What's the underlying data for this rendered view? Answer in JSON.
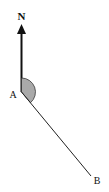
{
  "diagram": {
    "type": "bearing",
    "north_label": "N",
    "point_a_label": "A",
    "point_b_label": "B",
    "colors": {
      "line": "#222222",
      "sector_fill": "#a9a9a9",
      "background": "#ffffff"
    }
  }
}
